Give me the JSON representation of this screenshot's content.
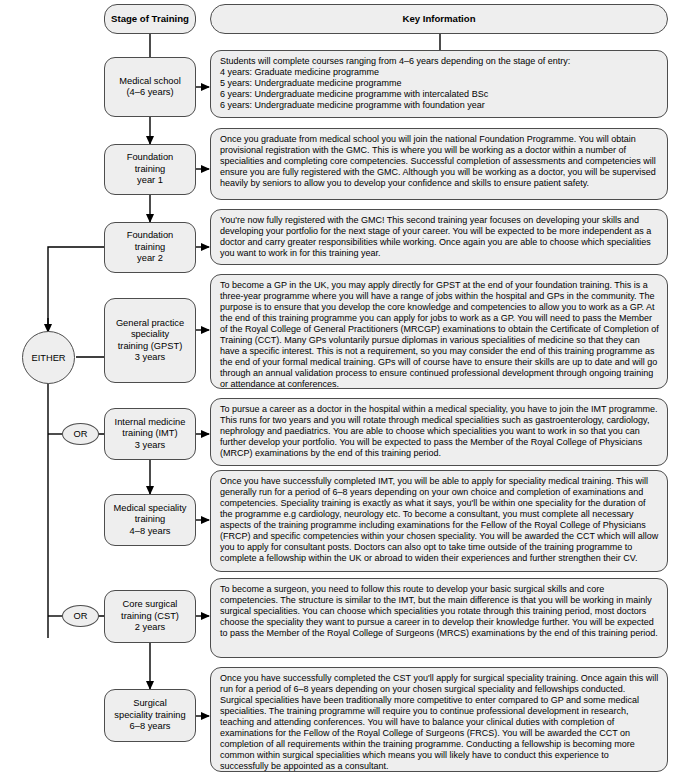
{
  "headers": {
    "stage_of_training": "Stage of Training",
    "key_information": "Key Information"
  },
  "branch_labels": {
    "either": "EITHER",
    "or_1": "OR",
    "or_2": "OR"
  },
  "stages": [
    {
      "id": "medical-school",
      "label": "Medical school\n(4–6 years)"
    },
    {
      "id": "foundation-year-1",
      "label": "Foundation\ntraining\nyear 1"
    },
    {
      "id": "foundation-year-2",
      "label": "Foundation\ntraining\nyear 2"
    },
    {
      "id": "gpst",
      "label": "General practice\nspeciality\ntraining (GPST)\n3 years"
    },
    {
      "id": "imt",
      "label": "Internal medicine\ntraining (IMT)\n3 years"
    },
    {
      "id": "medical-speciality-training",
      "label": "Medical speciality\ntraining\n4–8 years"
    },
    {
      "id": "cst",
      "label": "Core surgical\ntraining  (CST)\n2 years"
    },
    {
      "id": "surgical-speciality-training",
      "label": "Surgical\nspeciality training\n6–8 years"
    }
  ],
  "info": [
    {
      "id": "medical-school",
      "text": "Students will complete courses ranging from 4–6 years depending on the stage of entry:\n4 years: Graduate medicine programme\n5 years: Undergraduate medicine programme\n6 years: Undergraduate medicine programme with intercalated BSc\n6 years: Undergraduate medicine programme with foundation year"
    },
    {
      "id": "foundation-year-1",
      "text": "Once you graduate from medical school you will join the national Foundation Programme. You will obtain provisional registration with the GMC. This is where you will be working as a doctor within a number of specialities and completing core competencies. Successful completion of assessments and competencies will ensure you are fully registered with the GMC. Although you will be working as a doctor, you will be supervised heavily by seniors to allow you to develop your confidence and skills to ensure patient safety."
    },
    {
      "id": "foundation-year-2",
      "text": "You're now fully registered with the GMC! This second training year focuses on developing your skills and developing your portfolio for the next stage of your career. You will be expected to be more independent as a doctor and carry greater responsibilities while working. Once again you are able to choose which specialities you want to work in for this training year."
    },
    {
      "id": "gpst",
      "text": "To become a GP in the UK, you may apply directly for GPST at the end of your foundation training. This is a three-year programme where you will have a range of jobs within the hospital and GPs in the community. The purpose is to ensure that you develop the core knowledge and competencies to allow you to work as a GP. At the end of this training programme you can apply for jobs to work as a GP. You will need to pass the Member of the Royal College of General Practitioners (MRCGP) examinations to obtain the Certificate of Completion of Training (CCT). Many GPs voluntarily pursue diplomas in various specialities of medicine so that they can have a specific interest. This is not a requirement, so you may consider the end of this training programme as the end of your formal medical training. GPs will of course have to ensure their skills are up to date and will go through an annual validation process to ensure continued professional development through ongoing training or attendance at conferences."
    },
    {
      "id": "imt",
      "text": "To pursue a career as a doctor in the hospital within a medical speciality, you have to join the IMT programme. This runs for two years and you will rotate through medical specialities such as gastroenterology, cardiology, nephrology and paediatrics. You are able to choose which specialities you want to work in so that you can further develop your portfolio. You will be expected to pass the Member of the Royal College of Physicians (MRCP) examinations by the end of this training period."
    },
    {
      "id": "medical-speciality-training",
      "text": "Once you have successfully completed IMT, you will be able to apply for speciality medical training. This will generally run for a period of 6–8 years depending on your own choice and completion of examinations and competencies. Speciality training is exactly as what it says, you'll be within one speciality for the duration of the programme e.g cardiology, neurology etc. To become a consultant, you must complete all necessary aspects of the training programme including examinations for the Fellow of the Royal College of Physicians (FRCP) and specific competencies within your chosen speciality. You will be awarded the CCT which will allow you to apply for consultant posts. Doctors can also opt to take time outside of the training programme to complete a fellowship within the UK or abroad to widen their experiences and further strengthen their CV."
    },
    {
      "id": "cst",
      "text": "To become a surgeon, you need to follow this route to develop your basic surgical skills and core competencies. The structure is similar to the IMT, but the main difference is that you will be working in mainly surgical specialities. You can choose which specialities you rotate through this training period, most doctors choose the speciality they want to pursue a career in to develop their knowledge further. You will be expected to pass the Member of the Royal College of Surgeons (MRCS) examinations by the end of this training period."
    },
    {
      "id": "surgical-speciality-training",
      "text": "Once you have successfully completed the CST you'll apply for surgical speciality training. Once again this will run for a period of 6–8 years depending on your chosen surgical speciality and fellowships conducted. Surgical specialities have been traditionally more competitive to enter compared to GP and some medical specialities. The training programme will require you to continue professional development in research, teaching and attending conferences. You will have to balance your clinical duties with completion of examinations for the Fellow of the Royal College of Surgeons (FRCS). You will be awarded the CCT on completion of all requirements within the training programme. Conducting a fellowship is becoming more common within surgical specialities which means you will likely have to conduct this experience to successfully be appointed as a consultant."
    }
  ],
  "colors": {
    "node_fill": "#eeeeee",
    "node_border": "#4d4d4d",
    "connector": "#000000",
    "text": "#000000",
    "background": "#ffffff"
  }
}
